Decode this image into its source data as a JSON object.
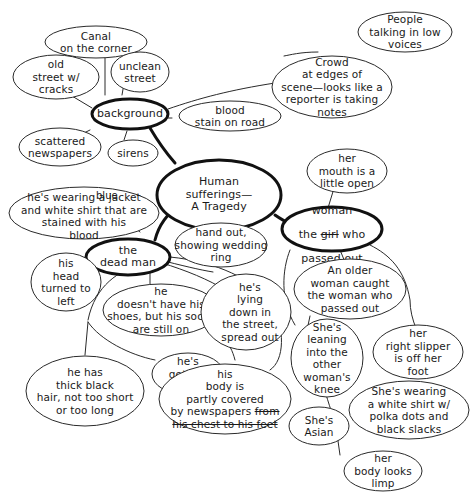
{
  "diagram": {
    "type": "mind-map",
    "central": {
      "id": "center",
      "text": "Human\nsufferings—\nA Tragedy"
    },
    "main_branches": [
      {
        "id": "background",
        "text": "background"
      },
      {
        "id": "dead_man",
        "text": "the\ndead man"
      },
      {
        "id": "woman",
        "text_line1_insert": "woman",
        "text_line2_prefix": "the ",
        "text_line2_struck": "girl",
        "text_line2_suffix": " who",
        "text_line3": "passed out"
      }
    ],
    "nodes": {
      "canal": "Canal\non the corner",
      "old_street": "old\nstreet w/\ncracks",
      "unclean_street": "unclean\nstreet",
      "scattered_newspapers": "scattered\nnewspapers",
      "sirens": "sirens",
      "blood_stain": "blood\nstain on road",
      "crowd": "Crowd\nat edges of\nscene—looks like a\nreporter is taking\nnotes",
      "people_talking": "People\ntalking in low\nvoices",
      "jacket": {
        "insert": "blue",
        "text": "he's wearing a jacket\nand white shirt that are\nstained with his\nblood"
      },
      "head_turned": "his\nhead\nturned to\nleft",
      "no_shoes": "he\ndoesn't have his\nshoes, but his socks\nare still on",
      "hand_out": "hand out,\nshowing wedding\nring",
      "lying_down": "he's\nlying\ndown in\nthe street,\nspread out",
      "getting_pale": "he's\ngetting\npale",
      "black_hair": "he has\nthick black\nhair, not too short\nor too long",
      "body_covered": {
        "text": "his\nbody is\npartly covered\nby newspapers ",
        "struck_a": "from",
        "struck_b": "his chest to his feet"
      },
      "mouth_open": "her\nmouth is a\nlittle open",
      "older_woman": "An older\nwoman caught\nthe woman who\npassed out",
      "leaning": "She's\nleaning\ninto the\nother\nwoman's\nknee",
      "slipper": "her\nright slipper\nis off her\nfoot",
      "white_shirt": "She's wearing\na white shirt w/\npolka dots and\nblack slacks",
      "asian": "She's\nAsian",
      "body_limp": "her\nbody looks\nlimp"
    },
    "colors": {
      "stroke": "#2a2a2a",
      "thick_stroke": "#111111",
      "background": "#ffffff"
    }
  }
}
